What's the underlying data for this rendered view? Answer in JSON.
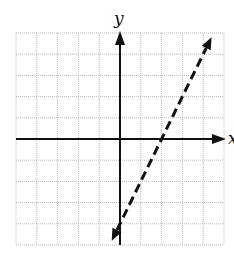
{
  "chart_data": {
    "type": "line",
    "title": "",
    "xlabel": "x",
    "ylabel": "y",
    "xlim": [
      -5,
      5
    ],
    "ylim": [
      -5,
      5
    ],
    "grid": true,
    "grid_step": 1,
    "tick_labels": false,
    "series": [
      {
        "name": "boundary line",
        "equation": "y = 2x - 4",
        "style": "dashed",
        "arrows": "both",
        "points": [
          [
            -0.4,
            -4.8
          ],
          [
            0,
            -4
          ],
          [
            2,
            0
          ],
          [
            4.4,
            4.8
          ]
        ]
      }
    ]
  },
  "labels": {
    "x_axis": "x",
    "y_axis": "y"
  },
  "colors": {
    "grid": "#b8b8b8",
    "axis": "#111111",
    "line": "#111111"
  }
}
